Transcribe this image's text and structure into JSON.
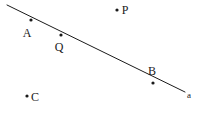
{
  "figure": {
    "kind": "geometry-line-diagram",
    "width": 200,
    "height": 117,
    "background_color": "#ffffff",
    "ink_color": "#1a1a1a",
    "line": {
      "name": "a",
      "label": "a",
      "label_x": 189,
      "label_y": 95,
      "x1": 7,
      "y1": 5,
      "x2": 185,
      "y2": 92,
      "stroke_width": 1
    },
    "points": [
      {
        "id": "A",
        "label": "A",
        "x": 31,
        "y": 20,
        "label_x": 27,
        "label_y": 33,
        "on_line": true
      },
      {
        "id": "Q",
        "label": "Q",
        "x": 61,
        "y": 35,
        "label_x": 59,
        "label_y": 47,
        "on_line": true
      },
      {
        "id": "B",
        "label": "B",
        "x": 153,
        "y": 83,
        "label_x": 152,
        "label_y": 71,
        "on_line": true
      },
      {
        "id": "P",
        "label": "P",
        "x": 117,
        "y": 10,
        "label_x": 125,
        "label_y": 10,
        "on_line": false
      },
      {
        "id": "C",
        "label": "C",
        "x": 27,
        "y": 96,
        "label_x": 35,
        "label_y": 97,
        "on_line": false
      }
    ],
    "dot_radius": 1.6
  }
}
